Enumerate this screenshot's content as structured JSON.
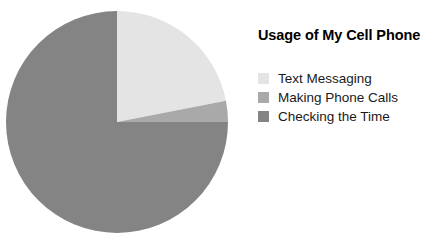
{
  "background_color": "#ffffff",
  "legend": {
    "title": "Usage of My Cell Phone",
    "title_color": "#000000",
    "label_color": "#1a1a1a",
    "items": [
      {
        "label": "Text Messaging",
        "color": "#e4e4e4"
      },
      {
        "label": "Making Phone Calls",
        "color": "#a9a9a9"
      },
      {
        "label": "Checking the Time",
        "color": "#848484"
      }
    ]
  },
  "chart_data": {
    "type": "pie",
    "title": "Usage of My Cell Phone",
    "categories": [
      "Text Messaging",
      "Making Phone Calls",
      "Checking the Time"
    ],
    "values": [
      22,
      3,
      75
    ],
    "value_unit": "percent",
    "start_angle_deg": 0,
    "direction": "clockwise",
    "slice_angles_deg": [
      79,
      11,
      270
    ],
    "colors": [
      "#e4e4e4",
      "#a9a9a9",
      "#848484"
    ],
    "center": [
      117,
      122
    ],
    "radius": 111,
    "grid": false,
    "legend_position": "right",
    "data_labels": false,
    "xlabel": "",
    "ylabel": ""
  }
}
